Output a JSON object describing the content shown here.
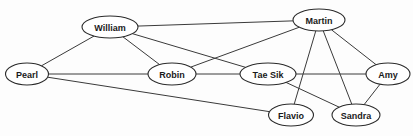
{
  "diagram": {
    "type": "undirected-node-link-graph",
    "canvas": {
      "width": 413,
      "height": 136,
      "background": "#fdfdfd"
    },
    "style": {
      "node_fill": "#ffffff",
      "node_stroke": "#2b2b2b",
      "edge_stroke": "#3a3a3a",
      "label_color": "#1a1a1a"
    },
    "nodes": [
      {
        "id": "william",
        "label": "William",
        "cx": 110,
        "cy": 27,
        "rx": 28,
        "ry": 11
      },
      {
        "id": "martin",
        "label": "Martin",
        "cx": 319,
        "cy": 20,
        "rx": 26,
        "ry": 11
      },
      {
        "id": "pearl",
        "label": "Pearl",
        "cx": 27,
        "cy": 74,
        "rx": 21.5,
        "ry": 11
      },
      {
        "id": "robin",
        "label": "Robin",
        "cx": 172,
        "cy": 74,
        "rx": 24,
        "ry": 11
      },
      {
        "id": "taesik",
        "label": "Tae Sik",
        "cx": 268,
        "cy": 74,
        "rx": 28,
        "ry": 11
      },
      {
        "id": "amy",
        "label": "Amy",
        "cx": 388,
        "cy": 74,
        "rx": 22,
        "ry": 11
      },
      {
        "id": "flavio",
        "label": "Flavio",
        "cx": 291,
        "cy": 115,
        "rx": 22.5,
        "ry": 11
      },
      {
        "id": "sandra",
        "label": "Sandra",
        "cx": 356,
        "cy": 115,
        "rx": 24,
        "ry": 11
      }
    ],
    "edges": [
      {
        "id": "e-william-martin",
        "source": "william",
        "target": "martin"
      },
      {
        "id": "e-william-pearl",
        "source": "william",
        "target": "pearl"
      },
      {
        "id": "e-william-robin",
        "source": "william",
        "target": "robin"
      },
      {
        "id": "e-william-taesik",
        "source": "william",
        "target": "taesik"
      },
      {
        "id": "e-martin-robin",
        "source": "martin",
        "target": "robin"
      },
      {
        "id": "e-martin-amy",
        "source": "martin",
        "target": "amy"
      },
      {
        "id": "e-martin-flavio",
        "source": "martin",
        "target": "flavio"
      },
      {
        "id": "e-martin-sandra",
        "source": "martin",
        "target": "sandra"
      },
      {
        "id": "e-pearl-robin",
        "source": "pearl",
        "target": "robin"
      },
      {
        "id": "e-pearl-flavio",
        "source": "pearl",
        "target": "flavio"
      },
      {
        "id": "e-robin-taesik",
        "source": "robin",
        "target": "taesik"
      },
      {
        "id": "e-taesik-amy",
        "source": "taesik",
        "target": "amy"
      },
      {
        "id": "e-taesik-sandra",
        "source": "taesik",
        "target": "sandra"
      },
      {
        "id": "e-amy-sandra",
        "source": "amy",
        "target": "sandra"
      }
    ]
  }
}
